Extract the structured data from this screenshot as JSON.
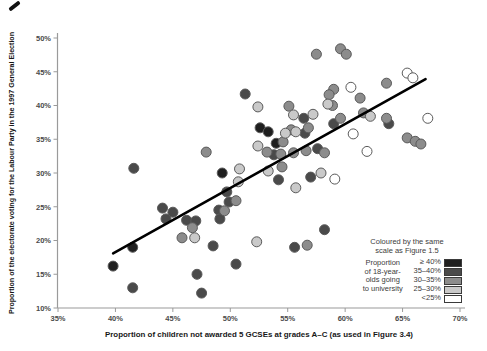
{
  "chart_data": {
    "type": "scatter",
    "title": "",
    "xlabel": "Proportion of children not awarded 5 GCSEs at grades A–C (as used in Figure 3.4)",
    "ylabel": "Proportion of the electorate voting for the Labour Party in the 1997 General Election",
    "xlim": [
      35,
      70
    ],
    "ylim": [
      10,
      50
    ],
    "grid": false,
    "xticks": [
      {
        "v": 35,
        "label": "35%"
      },
      {
        "v": 40,
        "label": "40%"
      },
      {
        "v": 45,
        "label": "45%"
      },
      {
        "v": 50,
        "label": "50%"
      },
      {
        "v": 55,
        "label": "55%"
      },
      {
        "v": 60,
        "label": "60%"
      },
      {
        "v": 65,
        "label": "65%"
      },
      {
        "v": 70,
        "label": "70%"
      }
    ],
    "yticks": [
      {
        "v": 10,
        "label": "10%"
      },
      {
        "v": 15,
        "label": "15%"
      },
      {
        "v": 20,
        "label": "20%"
      },
      {
        "v": 25,
        "label": "25%"
      },
      {
        "v": 30,
        "label": "30%"
      },
      {
        "v": 35,
        "label": "35%"
      },
      {
        "v": 40,
        "label": "40%"
      },
      {
        "v": 45,
        "label": "45%"
      },
      {
        "v": 50,
        "label": "50%"
      }
    ],
    "trend_line": {
      "x1": 39.8,
      "y1": 18.1,
      "x2": 67.0,
      "y2": 43.9,
      "color": "#000000",
      "width": 2.6
    },
    "point_style": {
      "radius": 5,
      "stroke": "#5a5a5a"
    },
    "series": [
      {
        "name": "≥ 40%",
        "color": "#1f1f1f",
        "points": [
          [
            52.6,
            36.7
          ],
          [
            53.3,
            36.1
          ],
          [
            54.0,
            34.4
          ],
          [
            49.3,
            30.0
          ],
          [
            41.5,
            19.0
          ],
          [
            39.8,
            16.2
          ]
        ]
      },
      {
        "name": "35–40%",
        "color": "#4a4a4a",
        "points": [
          [
            51.3,
            41.7
          ],
          [
            56.4,
            38.1
          ],
          [
            59.0,
            37.3
          ],
          [
            41.6,
            30.7
          ],
          [
            53.8,
            32.7
          ],
          [
            57.6,
            33.6
          ],
          [
            54.2,
            29.0
          ],
          [
            57.0,
            29.4
          ],
          [
            49.7,
            27.2
          ],
          [
            49.9,
            25.7
          ],
          [
            49.0,
            24.5
          ],
          [
            49.1,
            23.2
          ],
          [
            58.2,
            21.6
          ],
          [
            55.6,
            19.0
          ],
          [
            44.1,
            24.8
          ],
          [
            45.0,
            24.2
          ],
          [
            44.4,
            23.2
          ],
          [
            46.2,
            23.0
          ],
          [
            47.0,
            22.9
          ],
          [
            48.5,
            19.2
          ],
          [
            41.5,
            13.0
          ],
          [
            47.1,
            15.0
          ],
          [
            47.5,
            12.2
          ],
          [
            50.5,
            16.5
          ],
          [
            56.5,
            35.9
          ],
          [
            63.8,
            37.3
          ]
        ]
      },
      {
        "name": "30–35%",
        "color": "#8c8c8c",
        "points": [
          [
            57.5,
            47.6
          ],
          [
            59.6,
            48.4
          ],
          [
            60.1,
            47.6
          ],
          [
            63.6,
            43.3
          ],
          [
            59.0,
            42.4
          ],
          [
            55.1,
            39.9
          ],
          [
            58.6,
            41.6
          ],
          [
            61.3,
            41.1
          ],
          [
            58.9,
            40.0
          ],
          [
            61.6,
            38.9
          ],
          [
            63.6,
            38.1
          ],
          [
            59.6,
            38.1
          ],
          [
            47.9,
            33.1
          ],
          [
            55.3,
            36.4
          ],
          [
            56.8,
            36.7
          ],
          [
            54.6,
            34.6
          ],
          [
            53.2,
            33.1
          ],
          [
            54.4,
            32.8
          ],
          [
            55.5,
            33.0
          ],
          [
            56.6,
            33.3
          ],
          [
            58.2,
            33.0
          ],
          [
            54.5,
            30.9
          ],
          [
            50.5,
            25.9
          ],
          [
            46.7,
            21.9
          ],
          [
            45.8,
            20.4
          ],
          [
            56.7,
            19.3
          ],
          [
            65.4,
            35.2
          ],
          [
            66.1,
            34.7
          ],
          [
            66.6,
            34.3
          ],
          [
            49.5,
            24.4
          ]
        ]
      },
      {
        "name": "25–30%",
        "color": "#c9c9c9",
        "points": [
          [
            52.4,
            39.8
          ],
          [
            55.5,
            38.6
          ],
          [
            57.2,
            38.7
          ],
          [
            58.5,
            40.2
          ],
          [
            62.2,
            38.4
          ],
          [
            52.4,
            34.0
          ],
          [
            55.7,
            36.1
          ],
          [
            53.3,
            30.3
          ],
          [
            50.8,
            30.6
          ],
          [
            50.7,
            28.7
          ],
          [
            57.9,
            30.0
          ],
          [
            55.7,
            27.8
          ],
          [
            52.3,
            19.8
          ],
          [
            46.9,
            20.4
          ],
          [
            54.8,
            35.9
          ]
        ]
      },
      {
        "name": "<25%",
        "color": "#ffffff",
        "points": [
          [
            65.4,
            44.8
          ],
          [
            65.9,
            44.1
          ],
          [
            60.5,
            42.7
          ],
          [
            67.2,
            38.1
          ],
          [
            60.7,
            35.8
          ],
          [
            61.9,
            33.2
          ],
          [
            59.1,
            29.1
          ]
        ]
      }
    ],
    "legend": {
      "position": "bottom-right",
      "title_lines": [
        "Coloured by the same",
        "scale as Figure 1.5"
      ],
      "subtitle_lines": [
        "Proportion",
        "of 18-year-",
        "olds going",
        "to university"
      ],
      "items": [
        {
          "label": "≥ 40%",
          "color": "#1f1f1f"
        },
        {
          "label": "35–40%",
          "color": "#4a4a4a"
        },
        {
          "label": "30–35%",
          "color": "#8c8c8c"
        },
        {
          "label": "25–30%",
          "color": "#c9c9c9"
        },
        {
          "label": "<25%",
          "color": "#ffffff"
        }
      ]
    },
    "axis_color": "#9a9a9a",
    "tick_text_color": "#4a4a4a"
  }
}
